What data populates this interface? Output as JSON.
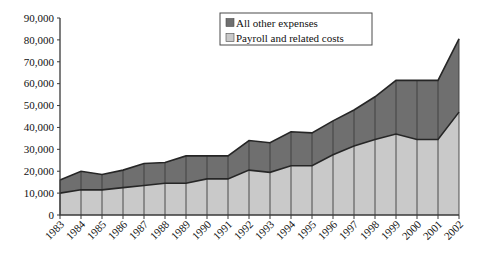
{
  "chart_data": {
    "type": "area",
    "title": "",
    "subtitle": "",
    "xlabel": "",
    "ylabel": "",
    "stacked": true,
    "grid": false,
    "legend_position": "top-center",
    "ylim": [
      0,
      90000
    ],
    "yticks": [
      0,
      10000,
      20000,
      30000,
      40000,
      50000,
      60000,
      70000,
      80000,
      90000
    ],
    "ytick_labels": [
      "0",
      "10,000",
      "20,000",
      "30,000",
      "40,000",
      "50,000",
      "60,000",
      "70,000",
      "80,000",
      "90,000"
    ],
    "categories": [
      "1983",
      "1984",
      "1985",
      "1986",
      "1987",
      "1988",
      "1989",
      "1990",
      "1991",
      "1992",
      "1993",
      "1994",
      "1995",
      "1996",
      "1997",
      "1998",
      "1999",
      "2000",
      "2001",
      "2002"
    ],
    "series": [
      {
        "name": "Payroll and related costs",
        "color": "#c9c9c9",
        "values": [
          10000,
          11500,
          11500,
          12500,
          13500,
          14500,
          14500,
          16500,
          16500,
          20500,
          19500,
          22500,
          22500,
          27500,
          31500,
          34500,
          37000,
          34500,
          34500,
          47000
        ]
      },
      {
        "name": "All other expenses",
        "color": "#6f6f6f",
        "values": [
          6000,
          8500,
          7000,
          8000,
          10000,
          9500,
          12500,
          10500,
          10500,
          13500,
          13500,
          15500,
          15000,
          15500,
          16500,
          19500,
          24500,
          27000,
          27000,
          33500
        ]
      }
    ],
    "totals": [
      16000,
      20000,
      18500,
      20500,
      23500,
      24000,
      27000,
      27000,
      27000,
      34000,
      33000,
      38000,
      37500,
      43000,
      48000,
      54000,
      61500,
      61500,
      61500,
      80500
    ],
    "annotations": []
  },
  "legend": {
    "items": [
      {
        "label": "All other expenses",
        "swatch_color": "#6f6f6f"
      },
      {
        "label": "Payroll and related costs",
        "swatch_color": "#c9c9c9"
      }
    ]
  },
  "colors": {
    "all_other_expenses": "#6f6f6f",
    "payroll_and_related_costs": "#c9c9c9",
    "axis": "#3a3a3a",
    "outline": "#262626",
    "background": "#ffffff"
  }
}
